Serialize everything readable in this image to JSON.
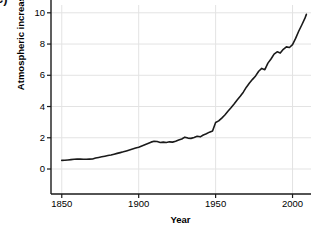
{
  "panel": {
    "label": "c)"
  },
  "chart_data": {
    "type": "line",
    "title": "",
    "xlabel": "Year",
    "ylabel": "Atmospheric increase",
    "xlim": [
      1843,
      2012
    ],
    "ylim": [
      -1.6,
      10.5
    ],
    "xticks": [
      1850,
      1900,
      1950,
      2000
    ],
    "xtick_labels": [
      "1850",
      "1900",
      "1950",
      "2000"
    ],
    "yticks": [
      0,
      2,
      4,
      6,
      8,
      10
    ],
    "ytick_labels": [
      "0",
      "2",
      "4",
      "6",
      "8",
      "10"
    ],
    "grid": true,
    "grid_color": "#e3e3e3",
    "legend": null,
    "line_color": "#1a1a1a",
    "line_width": 1.6,
    "series": [
      {
        "name": "Atmospheric increase",
        "x": [
          1850,
          1852,
          1854,
          1856,
          1858,
          1860,
          1862,
          1864,
          1866,
          1868,
          1870,
          1872,
          1874,
          1876,
          1878,
          1880,
          1882,
          1884,
          1886,
          1888,
          1890,
          1892,
          1894,
          1896,
          1898,
          1900,
          1902,
          1904,
          1906,
          1908,
          1910,
          1912,
          1914,
          1916,
          1918,
          1920,
          1922,
          1924,
          1926,
          1928,
          1930,
          1932,
          1934,
          1936,
          1938,
          1940,
          1942,
          1944,
          1946,
          1948,
          1950,
          1952,
          1954,
          1956,
          1958,
          1960,
          1962,
          1964,
          1966,
          1968,
          1970,
          1972,
          1974,
          1976,
          1978,
          1980,
          1982,
          1984,
          1986,
          1988,
          1990,
          1992,
          1994,
          1996,
          1998,
          2000,
          2002,
          2004,
          2006,
          2008,
          2009
        ],
        "values": [
          0.55,
          0.56,
          0.58,
          0.6,
          0.62,
          0.63,
          0.63,
          0.62,
          0.62,
          0.63,
          0.64,
          0.7,
          0.74,
          0.78,
          0.82,
          0.86,
          0.9,
          0.95,
          1.0,
          1.05,
          1.1,
          1.16,
          1.22,
          1.28,
          1.34,
          1.4,
          1.48,
          1.56,
          1.64,
          1.72,
          1.78,
          1.76,
          1.7,
          1.72,
          1.7,
          1.74,
          1.72,
          1.78,
          1.86,
          1.92,
          2.04,
          1.98,
          1.96,
          2.02,
          2.1,
          2.06,
          2.18,
          2.26,
          2.36,
          2.44,
          2.98,
          3.08,
          3.26,
          3.46,
          3.7,
          3.92,
          4.16,
          4.42,
          4.66,
          4.92,
          5.24,
          5.5,
          5.74,
          5.96,
          6.26,
          6.44,
          6.36,
          6.78,
          7.04,
          7.36,
          7.5,
          7.42,
          7.66,
          7.82,
          7.78,
          7.96,
          8.36,
          8.82,
          9.22,
          9.64,
          9.9
        ]
      }
    ]
  }
}
